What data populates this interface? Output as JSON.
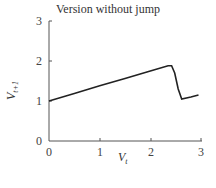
{
  "chart_data": {
    "type": "line",
    "title": "Version without jump",
    "xlabel": "V_t",
    "ylabel": "V_{t+1}",
    "xlim": [
      0,
      3
    ],
    "ylim": [
      0,
      3
    ],
    "xticks": [
      "0",
      "1",
      "2",
      "3"
    ],
    "yticks": [
      "0",
      "1",
      "2",
      "3"
    ],
    "grid": false,
    "series": [
      {
        "name": "V_{t+1}",
        "x": [
          0,
          0.5,
          1.0,
          1.5,
          2.0,
          2.35,
          2.42,
          2.48,
          2.55,
          2.62,
          2.8,
          2.95
        ],
        "y": [
          1.0,
          1.19,
          1.38,
          1.56,
          1.75,
          1.88,
          1.88,
          1.7,
          1.3,
          1.05,
          1.1,
          1.15
        ]
      }
    ]
  }
}
